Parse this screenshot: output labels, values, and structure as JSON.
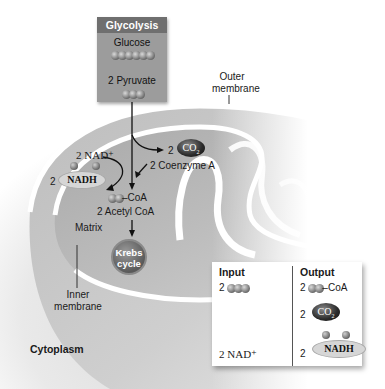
{
  "diagram": {
    "glycolysis_box": {
      "header": "Glycolysis",
      "start_label": "Glucose",
      "start_carbons": 6,
      "end_label": "2 Pyruvate",
      "end_carbons": 3
    },
    "labels": {
      "outer_membrane": "Outer membrane",
      "inner_membrane": "Inner membrane",
      "matrix": "Matrix",
      "cytoplasm": "Cytoplasm"
    },
    "reaction": {
      "nad_in_coef": "2",
      "nad_in": "NAD⁺",
      "nadh_out_coef": "2",
      "nadh_out": "NADH",
      "co2_out_coef": "2",
      "co2_label": "CO",
      "co2_sub": "2",
      "coenzyme_in": "2 Coenzyme A",
      "acetyl_group_suffix": "–CoA",
      "acetyl_label": "2 Acetyl CoA",
      "krebs_line1": "Krebs",
      "krebs_line2": "cycle"
    },
    "io_table": {
      "input_header": "Input",
      "output_header": "Output",
      "inputs": [
        {
          "coef": "2",
          "item": "pyruvate (3-carbon)",
          "carbons": 3
        },
        {
          "coef": "2",
          "item": "NAD⁺"
        }
      ],
      "outputs": [
        {
          "coef": "2",
          "item": "acetyl-CoA",
          "carbons": 2,
          "suffix": "–CoA"
        },
        {
          "coef": "2",
          "item": "CO",
          "sub": "2"
        },
        {
          "coef": "2",
          "item": "NADH"
        }
      ]
    },
    "colors": {
      "glycolysis_header": "#6f6f6f",
      "glycolysis_body": "#9c9c9c",
      "membrane_fill": "#c8c8c8",
      "matrix_fill": "#b4b4b4",
      "membrane_line": "#ffffff",
      "co2_fill": "#222222",
      "nadh_fill": "#d6d6d6"
    }
  }
}
